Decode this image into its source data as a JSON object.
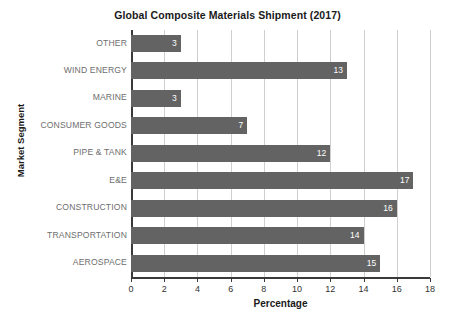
{
  "chart_data": {
    "type": "bar",
    "orientation": "horizontal",
    "title": "Global Composite Materials Shipment (2017)",
    "xlabel": "Percentage",
    "ylabel": "Market Segment",
    "categories": [
      "OTHER",
      "WIND ENERGY",
      "MARINE",
      "CONSUMER GOODS",
      "PIPE & TANK",
      "E&E",
      "CONSTRUCTION",
      "TRANSPORTATION",
      "AEROSPACE"
    ],
    "values": [
      3,
      13,
      3,
      7,
      12,
      17,
      16,
      14,
      15
    ],
    "xlim": [
      0,
      18
    ],
    "xticks": [
      0,
      2,
      4,
      6,
      8,
      10,
      12,
      14,
      16,
      18
    ],
    "xtick_labels": [
      "0",
      "2",
      "4",
      "6",
      "8",
      "10",
      "12",
      "14",
      "16",
      "18"
    ],
    "grid": "vertical",
    "legend": null,
    "bar_color": "#636363",
    "value_label_color": "#ffffff",
    "gridline_color": "#cfcfcf",
    "axis_color": "#3a3a3a",
    "category_label_color": "#6e6e6e",
    "background": "#ffffff"
  }
}
